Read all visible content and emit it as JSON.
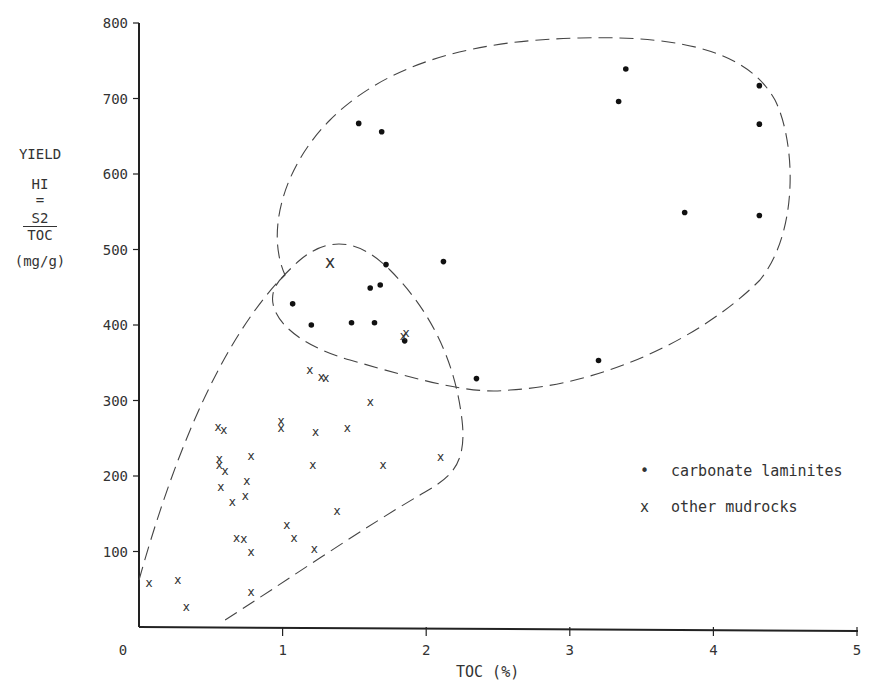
{
  "chart_data": {
    "type": "scatter",
    "title": "",
    "xlabel": "TOC (%)",
    "ylabel": "YIELD HI = S2/TOC (mg/g)",
    "xlim": [
      0,
      5
    ],
    "ylim": [
      0,
      800
    ],
    "x_ticks": [
      "0",
      "1",
      "2",
      "3",
      "4",
      "5"
    ],
    "y_ticks": [
      "100",
      "200",
      "300",
      "400",
      "500",
      "600",
      "700",
      "800"
    ],
    "grid": false,
    "legend_position": "right-middle",
    "series": [
      {
        "name": "carbonate laminites",
        "marker": "dot",
        "points": [
          [
            1.53,
            667
          ],
          [
            1.69,
            656
          ],
          [
            1.72,
            480
          ],
          [
            2.12,
            484
          ],
          [
            1.07,
            428
          ],
          [
            1.68,
            453
          ],
          [
            1.61,
            449
          ],
          [
            1.2,
            400
          ],
          [
            1.48,
            403
          ],
          [
            1.64,
            403
          ],
          [
            1.85,
            379
          ],
          [
            2.35,
            329
          ],
          [
            3.39,
            739
          ],
          [
            3.34,
            696
          ],
          [
            4.32,
            717
          ],
          [
            4.32,
            666
          ],
          [
            3.8,
            549
          ],
          [
            4.32,
            545
          ],
          [
            3.2,
            353
          ]
        ]
      },
      {
        "name": "other mudrocks",
        "marker": "x",
        "points": [
          [
            0.07,
            58
          ],
          [
            0.27,
            62
          ],
          [
            0.33,
            27
          ],
          [
            0.55,
            265
          ],
          [
            0.59,
            261
          ],
          [
            0.56,
            223
          ],
          [
            0.56,
            214
          ],
          [
            0.6,
            206
          ],
          [
            0.57,
            186
          ],
          [
            0.78,
            226
          ],
          [
            0.75,
            194
          ],
          [
            0.74,
            173
          ],
          [
            0.65,
            166
          ],
          [
            0.73,
            117
          ],
          [
            0.68,
            118
          ],
          [
            0.78,
            100
          ],
          [
            0.78,
            46
          ],
          [
            0.99,
            273
          ],
          [
            0.99,
            263
          ],
          [
            1.19,
            341
          ],
          [
            1.27,
            331
          ],
          [
            1.3,
            330
          ],
          [
            1.23,
            258
          ],
          [
            1.21,
            214
          ],
          [
            1.45,
            263
          ],
          [
            1.03,
            135
          ],
          [
            1.08,
            118
          ],
          [
            1.38,
            153
          ],
          [
            1.22,
            103
          ],
          [
            1.61,
            298
          ],
          [
            1.7,
            214
          ],
          [
            2.1,
            225
          ],
          [
            1.86,
            390
          ],
          [
            1.84,
            386
          ],
          [
            1.33,
            481
          ]
        ]
      }
    ],
    "annotations": [
      "dashed envelope around carbonate laminites",
      "dashed envelope around other mudrocks"
    ]
  },
  "axes": {
    "x_title": "TOC (%)",
    "y_title_line1": "YIELD",
    "y_title_line2": "HI",
    "y_title_eq": "=",
    "y_title_num": "S2",
    "y_title_den": "TOC",
    "y_title_units": "(mg/g)"
  },
  "legend": {
    "items": [
      {
        "symbol": "•",
        "label": "carbonate laminites"
      },
      {
        "symbol": "x",
        "label": "other mudrocks"
      }
    ]
  }
}
